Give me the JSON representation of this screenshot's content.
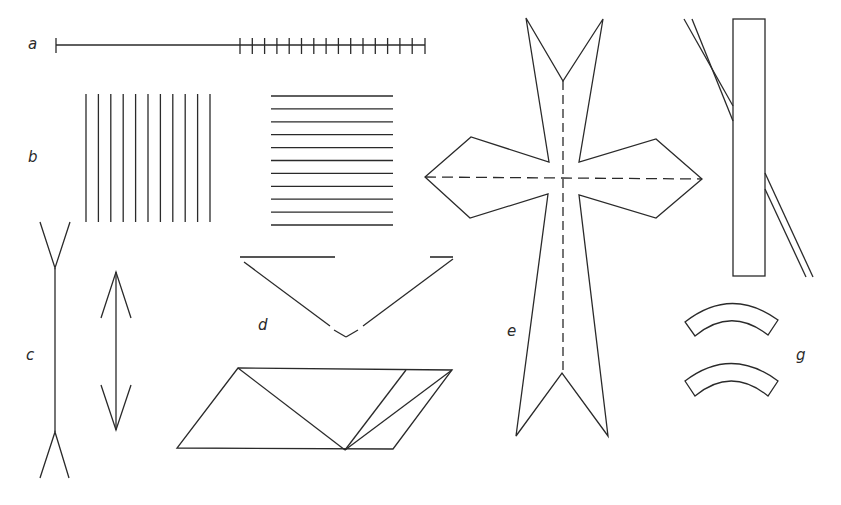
{
  "figure": {
    "labels": {
      "a": "a",
      "b": "b",
      "c": "c",
      "d": "d",
      "e": "e",
      "g": "g"
    },
    "panels": [
      {
        "id": "a",
        "name": "Oppel-Kundt filled vs unfilled extent",
        "ticks": 16
      },
      {
        "id": "b",
        "name": "Vertical vs horizontal line gratings",
        "vertical_lines": 11,
        "horizontal_lines": 11
      },
      {
        "id": "c",
        "name": "Müller-Lyer illusion"
      },
      {
        "id": "d",
        "name": "Subjective-contour triangle and Sander parallelogram"
      },
      {
        "id": "e",
        "name": "Cross figure with dashed axes"
      },
      {
        "id": "f",
        "name": "Poggendorff illusion"
      },
      {
        "id": "g",
        "name": "Jastrow illusion"
      }
    ],
    "colors": {
      "stroke": "#2a2a2a",
      "background": "#ffffff"
    }
  }
}
